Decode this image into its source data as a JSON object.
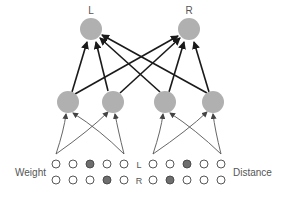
{
  "diagram": {
    "output_nodes": [
      {
        "label": "L",
        "x": 91,
        "y": 29
      },
      {
        "label": "R",
        "x": 189,
        "y": 29
      }
    ],
    "hidden_nodes": [
      {
        "x": 68,
        "y": 102
      },
      {
        "x": 113,
        "y": 102
      },
      {
        "x": 165,
        "y": 102
      },
      {
        "x": 213,
        "y": 102
      }
    ],
    "input_groups": {
      "left_label": "Weight",
      "right_label": "Distance",
      "row_labels": [
        "L",
        "R"
      ],
      "weight_rows": [
        [
          false,
          false,
          true,
          false,
          false
        ],
        [
          false,
          false,
          false,
          true,
          false
        ]
      ],
      "distance_rows": [
        [
          false,
          false,
          true,
          false,
          false
        ],
        [
          false,
          true,
          false,
          false,
          false
        ]
      ]
    },
    "colors": {
      "node_fill": "#b0b0b0",
      "active_input": "#6e6e6e",
      "edge": "#1a1a1a",
      "thin_edge": "#555555",
      "label": "#555555"
    }
  }
}
